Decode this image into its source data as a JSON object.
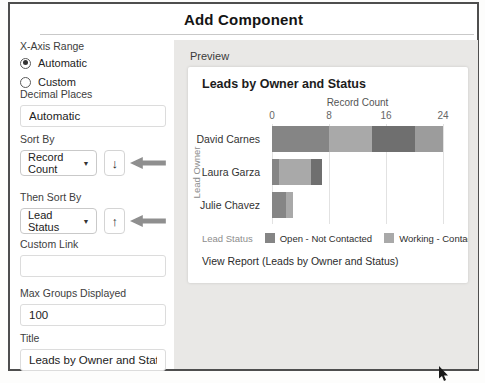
{
  "dialog": {
    "title": "Add Component"
  },
  "left_panel": {
    "x_axis_range": {
      "label": "X-Axis Range",
      "options": [
        {
          "label": "Automatic",
          "selected": true
        },
        {
          "label": "Custom",
          "selected": false
        }
      ]
    },
    "decimal_places": {
      "label": "Decimal Places",
      "value": "Automatic"
    },
    "sort_by": {
      "label": "Sort By",
      "value": "Record Count",
      "direction_glyph": "↓"
    },
    "then_sort_by": {
      "label": "Then Sort By",
      "value": "Lead Status",
      "direction_glyph": "↑"
    },
    "custom_link": {
      "label": "Custom Link",
      "value": ""
    },
    "max_groups_displayed": {
      "label": "Max Groups Displayed",
      "value": "100"
    },
    "title_field": {
      "label": "Title",
      "value": "Leads by Owner and Status"
    }
  },
  "preview": {
    "label": "Preview",
    "view_report_text": "View Report (Leads by Owner and Status)"
  },
  "chart_data": {
    "type": "bar",
    "variant": "horizontal-stacked",
    "title": "Leads by Owner and Status",
    "xlabel": "Record Count",
    "ylabel": "Lead Owner",
    "xlim": [
      0,
      24
    ],
    "xticks": [
      0,
      8,
      16,
      24
    ],
    "grid": true,
    "categories": [
      "David Carnes",
      "Laura Garza",
      "Julie Chavez"
    ],
    "series": [
      {
        "name": "Open - Not Contacted",
        "color": "#858585",
        "values": [
          8,
          1,
          2
        ]
      },
      {
        "name": "Working - Contacted",
        "color": "#a9a9a9",
        "values": [
          6,
          4.5,
          1
        ]
      },
      {
        "name": "C (legend label cut off at panel edge)",
        "color": "#6f6f6f",
        "values": [
          6,
          1.5,
          0
        ]
      },
      {
        "name": "(fourth segment, legend not visible)",
        "color": "#9c9c9c",
        "values": [
          4,
          0,
          0
        ]
      }
    ],
    "legend": {
      "title": "Lead Status",
      "position": "bottom",
      "visible_items": [
        "Open - Not Contacted",
        "Working - Contacted",
        "C"
      ]
    }
  },
  "annotations": {
    "arrow_color": "#8f8f8f",
    "arrows": [
      {
        "points_at": "sort-by-direction-button",
        "direction": "left"
      },
      {
        "points_at": "then-sort-by-direction-button",
        "direction": "left"
      }
    ]
  }
}
